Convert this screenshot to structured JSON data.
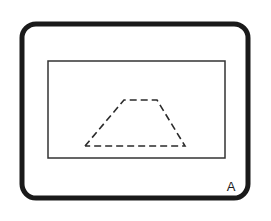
{
  "figure": {
    "panel_label": "A",
    "background_color": "#ffffff",
    "width": 271,
    "height": 221
  },
  "outer_frame": {
    "name": "rounded-rectangle-frame",
    "stroke_color": "#1a1a1a",
    "stroke_width": 5,
    "corner_radius": 14,
    "x": 22,
    "y": 24,
    "width": 226,
    "height": 174,
    "fill": "none"
  },
  "inner_rectangle": {
    "name": "inner-rectangle",
    "stroke_color": "#333333",
    "stroke_width": 1.5,
    "x": 48,
    "y": 61,
    "width": 177,
    "height": 97,
    "fill": "none"
  },
  "dashed_trapezoid": {
    "name": "dashed-trapezoid",
    "stroke_color": "#2b2b2b",
    "stroke_width": 1.6,
    "dash_pattern": "7 4",
    "fill": "none",
    "points": "85,146 124,100 157,100 185,146 85,146",
    "vertices": [
      {
        "label": "bottom-left",
        "x": 85,
        "y": 146
      },
      {
        "label": "top-left",
        "x": 124,
        "y": 100
      },
      {
        "label": "top-right",
        "x": 157,
        "y": 100
      },
      {
        "label": "bottom-right",
        "x": 185,
        "y": 146
      }
    ]
  },
  "label": {
    "text": "A",
    "color": "#1a1a1a",
    "font_size": 13,
    "x": 231,
    "y": 191
  }
}
